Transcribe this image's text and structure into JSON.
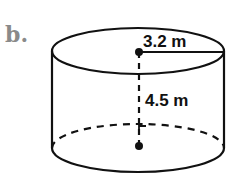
{
  "problem_label": "b.",
  "figure": {
    "shape": "cylinder",
    "radius_label": "3.2 m",
    "height_label": "4.5 m"
  },
  "colors": {
    "line": "#111111",
    "label": "#8a8a8a",
    "background": "#ffffff"
  }
}
